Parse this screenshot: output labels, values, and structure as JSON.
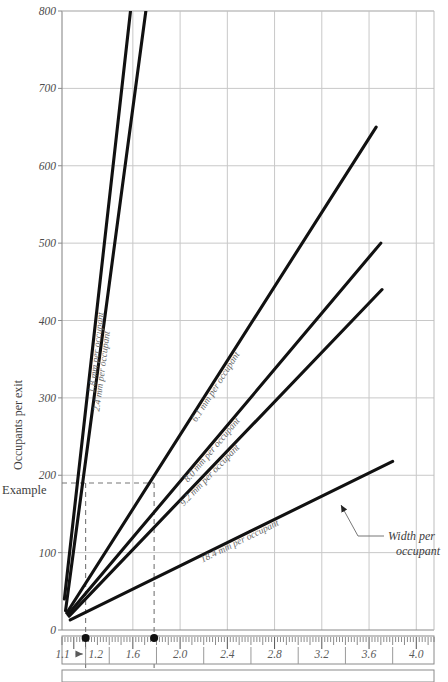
{
  "chart_data": {
    "type": "line",
    "title": "",
    "ylabel": "Occupants per exit",
    "xlabel": "",
    "ylim": [
      0,
      800
    ],
    "xlim": [
      1.0,
      4.15
    ],
    "grid": true,
    "legend": "inline-curve-labels",
    "ytick_labels": [
      "0",
      "100",
      "200",
      "300",
      "400",
      "500",
      "600",
      "700",
      "800"
    ],
    "ytick_values": [
      0,
      100,
      200,
      300,
      400,
      500,
      600,
      700,
      800
    ],
    "xtick_labels": [
      "1.1",
      "1.2",
      "1.6",
      "2.0",
      "2.4",
      "2.8",
      "3.2",
      "3.6",
      "4.0"
    ],
    "xtick_values": [
      1.1,
      1.2,
      1.6,
      2.0,
      2.4,
      2.8,
      3.2,
      3.6,
      4.0
    ],
    "x_gridline_values": [
      1.6,
      2.0,
      2.4,
      2.8,
      3.2,
      3.6,
      4.0
    ],
    "series": [
      {
        "name": "1.8 mm per occupant",
        "label": "1.8 mm per occupant",
        "x": [
          1.02,
          1.58
        ],
        "y": [
          40,
          800
        ]
      },
      {
        "name": "2.4 mm per occupant",
        "label": "2.4 mm per occupant",
        "x": [
          1.03,
          1.71
        ],
        "y": [
          25,
          800
        ]
      },
      {
        "name": "6.1 mm per occupant",
        "label": "6.1 mm per occupant",
        "x": [
          1.04,
          3.66
        ],
        "y": [
          22,
          650
        ]
      },
      {
        "name": "8.0 mm per occupant",
        "label": "8.0 mm per occupant",
        "x": [
          1.05,
          3.7
        ],
        "y": [
          20,
          500
        ]
      },
      {
        "name": "9.2 mm per occupant",
        "label": "9.2 mm per occupant",
        "x": [
          1.06,
          3.71
        ],
        "y": [
          18,
          440
        ]
      },
      {
        "name": "18.4 mm per occupant",
        "label": "18.4 mm per occupant",
        "x": [
          1.07,
          3.8
        ],
        "y": [
          13,
          218
        ]
      }
    ],
    "annotations": [
      {
        "name": "example-label",
        "text": "Example"
      },
      {
        "name": "width-per-occupant-callout",
        "line1": "Width per",
        "line2": "occupant"
      }
    ],
    "example_guides": {
      "horizontal_value": 190,
      "marker_points": [
        1.2,
        1.78
      ]
    }
  },
  "colors": {
    "curve": "#111111",
    "grid": "#c8c8c8",
    "axis": "#8a8a8a",
    "text": "#444444",
    "dash": "#777777"
  },
  "scale_bar": {
    "name": "width-ruler",
    "ticks_minor": true,
    "labels": [
      "1.1",
      "1.2",
      "1.6",
      "2.0",
      "2.4",
      "2.8",
      "3.2",
      "3.6",
      "4.0"
    ]
  }
}
